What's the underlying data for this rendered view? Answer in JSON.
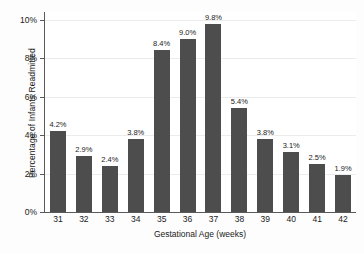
{
  "chart_data": {
    "type": "bar",
    "title": "",
    "subtitle": "",
    "xlabel": "Gestational Age (weeks)",
    "ylabel": "Percentage of Infants Readmitted",
    "categories": [
      "31",
      "32",
      "33",
      "34",
      "35",
      "36",
      "37",
      "38",
      "39",
      "40",
      "41",
      "42"
    ],
    "values": [
      4.2,
      2.9,
      2.4,
      3.8,
      8.4,
      9.0,
      9.8,
      5.4,
      3.8,
      3.1,
      2.5,
      1.9
    ],
    "data_labels": [
      "4.2%",
      "2.9%",
      "2.4%",
      "3.8%",
      "8.4%",
      "9.0%",
      "9.8%",
      "5.4%",
      "3.8%",
      "3.1%",
      "2.5%",
      "1.9%"
    ],
    "ylim": [
      0,
      10.4
    ],
    "ytick_values": [
      0,
      2,
      4,
      6,
      8,
      10
    ],
    "ytick_labels": [
      "0%",
      "2%",
      "4%",
      "6%",
      "8%",
      "10%"
    ],
    "grid": true,
    "grid_axis": "y",
    "legend": null,
    "bar_color": "#4d4d4d",
    "axis_color": "#5a5a5a",
    "grid_color": "#ececec",
    "background_color": "#ffffff"
  },
  "caption_fragment": ""
}
